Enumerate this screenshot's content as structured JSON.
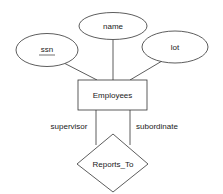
{
  "diagram": {
    "type": "er-diagram",
    "entity": {
      "label": "Employees"
    },
    "attributes": [
      {
        "label": "ssn",
        "key": true
      },
      {
        "label": "name",
        "key": false
      },
      {
        "label": "lot",
        "key": false
      }
    ],
    "relationship": {
      "label": "Reports_To"
    },
    "roles": [
      {
        "label": "supervisor"
      },
      {
        "label": "subordinate"
      }
    ],
    "colors": {
      "stroke": "#333333",
      "background": "#ffffff",
      "text": "#1a1a1a"
    }
  }
}
